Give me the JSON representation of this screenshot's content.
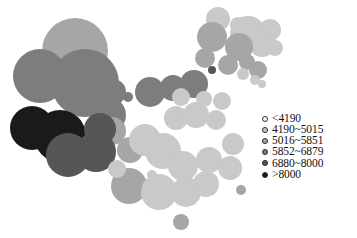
{
  "figure": {
    "title": "",
    "background_color": "#ffffff",
    "width": 357,
    "height": 238
  },
  "legend": {
    "name": "value-class-legend",
    "position": "right-middle",
    "items": [
      {
        "label": "<4190",
        "color": "#ffffff",
        "min": null,
        "max": 4190
      },
      {
        "label": "4190~5015",
        "color": "#c9c9c9",
        "min": 4190,
        "max": 5015
      },
      {
        "label": "5016~5851",
        "color": "#a6a6a6",
        "min": 5016,
        "max": 5851
      },
      {
        "label": "5852~6879",
        "color": "#7d7d7d",
        "min": 5852,
        "max": 6879
      },
      {
        "label": "6880~8000",
        "color": "#565656",
        "min": 6880,
        "max": 8000
      },
      {
        "label": ">8000",
        "color": "#1a1a1a",
        "min": 8000,
        "max": null
      }
    ]
  },
  "chart_data": {
    "type": "scatter",
    "title": "",
    "subtitle": "",
    "xlabel": "",
    "ylabel": "",
    "grid": false,
    "legend_position": "right",
    "class_breaks": [
      4190,
      5015,
      5851,
      6879,
      8000
    ],
    "class_colors": [
      "#ffffff",
      "#c9c9c9",
      "#a6a6a6",
      "#7d7d7d",
      "#565656",
      "#1a1a1a"
    ],
    "point_encoding": "radius = magnitude, fill = value class",
    "points": [
      {
        "x": 218,
        "y": 19,
        "r": 12,
        "class": 1
      },
      {
        "x": 238,
        "y": 25,
        "r": 8,
        "class": 1
      },
      {
        "x": 248,
        "y": 34,
        "r": 18,
        "class": 1
      },
      {
        "x": 270,
        "y": 30,
        "r": 11,
        "class": 1
      },
      {
        "x": 262,
        "y": 44,
        "r": 13,
        "class": 1
      },
      {
        "x": 275,
        "y": 48,
        "r": 8,
        "class": 1
      },
      {
        "x": 239,
        "y": 47,
        "r": 14,
        "class": 2
      },
      {
        "x": 212,
        "y": 37,
        "r": 15,
        "class": 2
      },
      {
        "x": 205,
        "y": 58,
        "r": 10,
        "class": 2
      },
      {
        "x": 212,
        "y": 70,
        "r": 4,
        "class": 4
      },
      {
        "x": 228,
        "y": 65,
        "r": 10,
        "class": 2
      },
      {
        "x": 247,
        "y": 62,
        "r": 8,
        "class": 2
      },
      {
        "x": 258,
        "y": 70,
        "r": 9,
        "class": 2
      },
      {
        "x": 243,
        "y": 74,
        "r": 6,
        "class": 1
      },
      {
        "x": 255,
        "y": 80,
        "r": 5,
        "class": 1
      },
      {
        "x": 262,
        "y": 84,
        "r": 4,
        "class": 1
      },
      {
        "x": 75,
        "y": 51,
        "r": 33,
        "class": 2
      },
      {
        "x": 40,
        "y": 76,
        "r": 27,
        "class": 3
      },
      {
        "x": 85,
        "y": 83,
        "r": 34,
        "class": 3
      },
      {
        "x": 113,
        "y": 92,
        "r": 13,
        "class": 3
      },
      {
        "x": 128,
        "y": 97,
        "r": 5,
        "class": 3
      },
      {
        "x": 141,
        "y": 99,
        "r": 3,
        "class": 3
      },
      {
        "x": 150,
        "y": 92,
        "r": 15,
        "class": 3
      },
      {
        "x": 173,
        "y": 88,
        "r": 13,
        "class": 3
      },
      {
        "x": 194,
        "y": 84,
        "r": 14,
        "class": 3
      },
      {
        "x": 108,
        "y": 115,
        "r": 18,
        "class": 3
      },
      {
        "x": 112,
        "y": 131,
        "r": 14,
        "class": 2
      },
      {
        "x": 32,
        "y": 128,
        "r": 22,
        "class": 5
      },
      {
        "x": 60,
        "y": 136,
        "r": 26,
        "class": 5
      },
      {
        "x": 68,
        "y": 155,
        "r": 22,
        "class": 4
      },
      {
        "x": 96,
        "y": 152,
        "r": 20,
        "class": 4
      },
      {
        "x": 100,
        "y": 129,
        "r": 16,
        "class": 4
      },
      {
        "x": 130,
        "y": 150,
        "r": 13,
        "class": 2
      },
      {
        "x": 145,
        "y": 140,
        "r": 16,
        "class": 1
      },
      {
        "x": 163,
        "y": 151,
        "r": 18,
        "class": 1
      },
      {
        "x": 176,
        "y": 118,
        "r": 12,
        "class": 1
      },
      {
        "x": 196,
        "y": 115,
        "r": 13,
        "class": 1
      },
      {
        "x": 216,
        "y": 120,
        "r": 10,
        "class": 1
      },
      {
        "x": 181,
        "y": 97,
        "r": 9,
        "class": 1
      },
      {
        "x": 204,
        "y": 99,
        "r": 8,
        "class": 1
      },
      {
        "x": 222,
        "y": 101,
        "r": 9,
        "class": 1
      },
      {
        "x": 129,
        "y": 186,
        "r": 18,
        "class": 2
      },
      {
        "x": 159,
        "y": 192,
        "r": 18,
        "class": 1
      },
      {
        "x": 186,
        "y": 192,
        "r": 15,
        "class": 1
      },
      {
        "x": 206,
        "y": 184,
        "r": 13,
        "class": 1
      },
      {
        "x": 183,
        "y": 166,
        "r": 15,
        "class": 1
      },
      {
        "x": 209,
        "y": 160,
        "r": 13,
        "class": 1
      },
      {
        "x": 230,
        "y": 168,
        "r": 12,
        "class": 1
      },
      {
        "x": 233,
        "y": 144,
        "r": 11,
        "class": 1
      },
      {
        "x": 241,
        "y": 190,
        "r": 5,
        "class": 2
      },
      {
        "x": 181,
        "y": 222,
        "r": 8,
        "class": 2
      },
      {
        "x": 152,
        "y": 175,
        "r": 5,
        "class": 1
      },
      {
        "x": 117,
        "y": 169,
        "r": 9,
        "class": 1
      }
    ]
  }
}
